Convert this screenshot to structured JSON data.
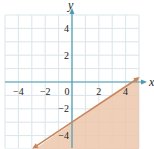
{
  "chart_data": {
    "type": "line",
    "title": "",
    "xlabel": "x",
    "ylabel": "y",
    "xlim": [
      -5,
      5
    ],
    "ylim": [
      -5,
      5
    ],
    "grid": true,
    "x_tick_labels": [
      "−4",
      "−2",
      "0",
      "2",
      "4"
    ],
    "x_ticks": [
      -4,
      -2,
      0,
      2,
      4
    ],
    "y_tick_labels": [
      "4",
      "2",
      "−2",
      "−4"
    ],
    "y_ticks": [
      4,
      2,
      -2,
      -4
    ],
    "series": [
      {
        "name": "boundary line y = (2/3)x − 3",
        "equation": "y = (2/3)x - 3",
        "slope": 0.6667,
        "intercept": -3,
        "points": [
          [
            -3,
            -5
          ],
          [
            0,
            -3
          ],
          [
            4.5,
            0
          ],
          [
            5,
            0.33
          ]
        ],
        "style": "solid",
        "arrows": "both ends"
      }
    ],
    "shaded_region": {
      "description": "half-plane below the line",
      "inequality": "y <= (2/3)x - 3"
    },
    "annotations": []
  },
  "colors": {
    "background": "#ffffff",
    "grid": "#dbe5ea",
    "axis": "#4a9bb0",
    "boundary_line": "#c9865c",
    "shade_fill": "#ecc7ab"
  }
}
